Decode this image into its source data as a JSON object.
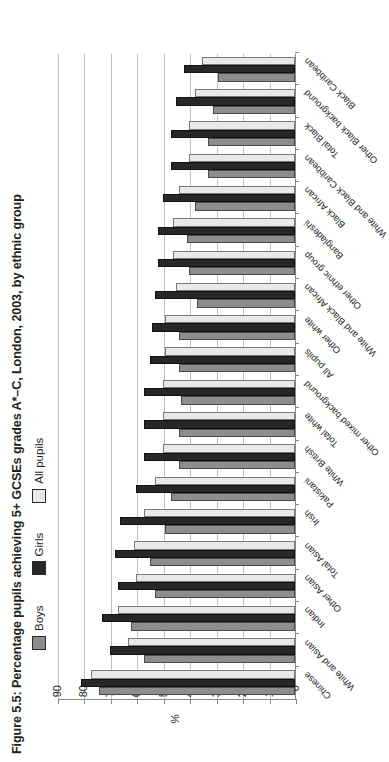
{
  "figure": {
    "title": "Figure 5.5: Percentage pupils achieving 5+ GCSEs grades A*–C, London, 2003, by ethnic group"
  },
  "legend": {
    "position": "top",
    "items": [
      {
        "label": "Boys",
        "color": "#8d8d8d",
        "swatch_name": "legend-swatch-boys"
      },
      {
        "label": "Girls",
        "color": "#272727",
        "swatch_name": "legend-swatch-girls"
      },
      {
        "label": "All pupils",
        "color": "#e8e8e6",
        "swatch_name": "legend-swatch-all-pupils"
      }
    ]
  },
  "axis": {
    "value_label": "%",
    "ticks": [
      "0",
      "10",
      "20",
      "30",
      "40",
      "50",
      "60",
      "70",
      "80",
      "90"
    ]
  },
  "chart_data": {
    "type": "bar",
    "title": "Figure 5.5: Percentage pupils achieving 5+ GCSEs grades A*–C, London, 2003, by ethnic group",
    "xlabel": "",
    "ylabel": "%",
    "ylim": [
      0,
      90
    ],
    "grid": true,
    "legend_position": "top",
    "orientation": "vertical",
    "categories": [
      "Chinese",
      "White and Asian",
      "Indian",
      "Other Asian",
      "Total Asian",
      "Irish",
      "Pakistani",
      "White British",
      "Total white",
      "Other mixed background",
      "All pupils",
      "Other white",
      "White and Black African",
      "Other ethnic group",
      "Bangladeshi",
      "Black African",
      "White and Black Caribbean",
      "Total Black",
      "Other Black background",
      "Black Caribbean"
    ],
    "series": [
      {
        "name": "Boys",
        "color": "#8d8d8d",
        "values": [
          74,
          57,
          62,
          53,
          55,
          49,
          47,
          44,
          44,
          43,
          44,
          44,
          37,
          40,
          41,
          38,
          33,
          33,
          31,
          29
        ]
      },
      {
        "name": "Girls",
        "color": "#272727",
        "values": [
          81,
          70,
          73,
          67,
          68,
          66,
          60,
          57,
          57,
          57,
          55,
          54,
          53,
          52,
          52,
          50,
          47,
          47,
          45,
          42
        ]
      },
      {
        "name": "All pupils",
        "color": "#e8e8e6",
        "values": [
          77,
          63,
          67,
          60,
          61,
          57,
          53,
          50,
          50,
          50,
          49,
          49,
          45,
          46,
          46,
          44,
          40,
          40,
          38,
          35
        ]
      }
    ]
  }
}
